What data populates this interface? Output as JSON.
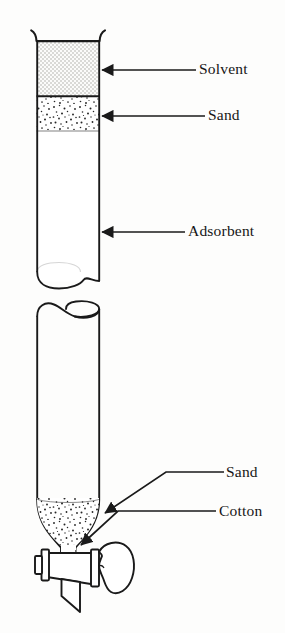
{
  "figure": {
    "name": "chromatography-column",
    "background_color": "#fdfdfc",
    "ink_color": "#1a1a1a"
  },
  "labels": {
    "solvent": "Solvent",
    "sand_top": "Sand",
    "adsorbent": "Adsorbent",
    "sand_bottom": "Sand",
    "cotton": "Cotton"
  },
  "regions": [
    {
      "name": "solvent-band",
      "label": "Solvent",
      "fill_pattern": "fine-checker-dots",
      "fill_color": "#e9e9e7",
      "y_top": 41,
      "y_bottom": 96
    },
    {
      "name": "sand-band-top",
      "label": "Sand",
      "fill_pattern": "coarse-stipple",
      "fill_color": "#ffffff",
      "y_top": 96,
      "y_bottom": 131
    },
    {
      "name": "adsorbent-band",
      "label": "Adsorbent",
      "fill_pattern": "none",
      "fill_color": "#ffffff",
      "y_top": 131,
      "y_bottom": 281
    },
    {
      "name": "sand-plug-bottom",
      "label": "Sand",
      "fill_pattern": "coarse-stipple",
      "fill_color": "#ffffff",
      "y_top": 498,
      "y_bottom": 545
    }
  ],
  "column": {
    "left_wall_x": 36,
    "right_wall_x": 100,
    "top_y": 30,
    "break_upper_y": 281,
    "break_lower_y": 307,
    "funnel_start_y": 498,
    "neck_y": 548
  },
  "stopcock": {
    "name": "stopcock-valve",
    "barrel_left_x": 47,
    "barrel_right_x": 97,
    "center_y": 562,
    "has_left_cap": true,
    "has_right_knob": true,
    "has_outlet_tip": true
  },
  "leaders": [
    {
      "name": "leader-solvent",
      "style": "arrow-left",
      "target": "solvent-band"
    },
    {
      "name": "leader-sand-top",
      "style": "arrow-left",
      "target": "sand-band-top"
    },
    {
      "name": "leader-adsorbent",
      "style": "arrow-left",
      "target": "adsorbent-band"
    },
    {
      "name": "leader-sand-bottom",
      "style": "arrow-diagonal-down-left",
      "target": "sand-plug-bottom"
    },
    {
      "name": "leader-cotton",
      "style": "arrow-kinked-left",
      "target": "cotton-plug"
    }
  ]
}
